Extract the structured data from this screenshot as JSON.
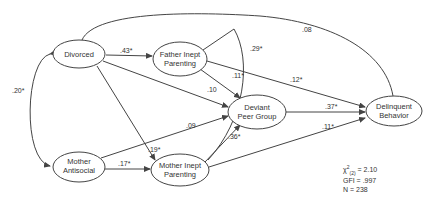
{
  "nodes": {
    "divorced": {
      "line1": "Divorced",
      "line2": ""
    },
    "father_inept": {
      "line1": "Father Inept",
      "line2": "Parenting"
    },
    "deviant_peer": {
      "line1": "Deviant",
      "line2": "Peer Group"
    },
    "delinquent": {
      "line1": "Delinquent",
      "line2": "Behavior"
    },
    "mother_antisocial": {
      "line1": "Mother",
      "line2": "Antisocial"
    },
    "mother_inept": {
      "line1": "Mother Inept",
      "line2": "Parenting"
    }
  },
  "paths": {
    "divorced_father": ".43*",
    "divorced_mother_antisocial": ".20*",
    "divorced_delinquent": ".08",
    "divorced_deviant": ".10",
    "divorced_mother_inept": ".19*",
    "father_deviant": ".11*",
    "father_delinquent": ".12*",
    "father_mother_inept_corr": ".29*",
    "deviant_delinquent": ".37*",
    "mother_antisocial_deviant": ".09",
    "mother_antisocial_mother_inept": ".17*",
    "mother_inept_deviant": ".36*",
    "mother_inept_delinquent": ".11*"
  },
  "fit_stats": {
    "chi_symbol": "χ",
    "chi_sup": "2",
    "chi_sub": "(2)",
    "chi_value": " = 2.10",
    "gfi": "GFI = .997",
    "n": "N = 238"
  },
  "colors": {
    "line": "#444444",
    "text": "#333333",
    "background": "#ffffff"
  }
}
